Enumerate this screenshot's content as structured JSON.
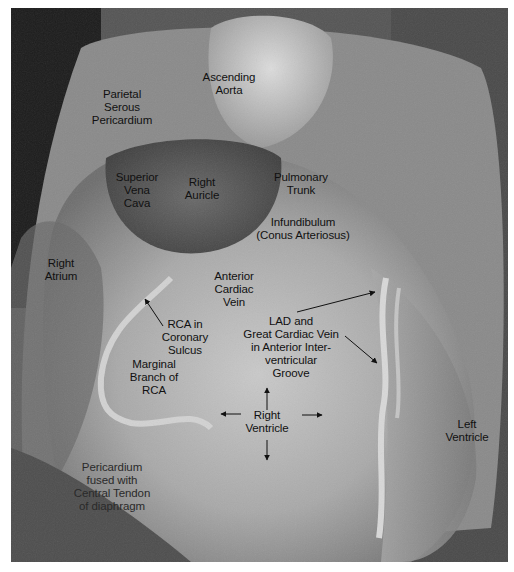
{
  "image": {
    "subject": "Anterior view of dissected heart in pericardium (grayscale photograph)",
    "background_color": "#ffffff",
    "photo_tone": "grayscale"
  },
  "labels": {
    "ascending_aorta": "Ascending\nAorta",
    "parietal_serous_pericardium": "Parietal\nSerous\nPericardium",
    "superior_vena_cava": "Superior\nVena\nCava",
    "right_auricle": "Right\nAuricle",
    "pulmonary_trunk": "Pulmonary\nTrunk",
    "infundibulum": "Infundibulum\n(Conus Arteriosus)",
    "right_atrium": "Right\nAtrium",
    "anterior_cardiac_vein": "Anterior\nCardiac\nVein",
    "rca_coronary_sulcus": "RCA in\nCoronary\nSulcus",
    "lad_great_cardiac_vein": "LAD and\nGreat Cardiac Vein\nin Anterior Inter-\nventricular\nGroove",
    "marginal_branch_rca": "Marginal\nBranch of\nRCA",
    "right_ventricle": "Right\nVentricle",
    "left_ventricle": "Left\nVentricle",
    "pericardium_diaphragm": "Pericardium\nfused with\nCentral Tendon\nof diaphragm"
  }
}
